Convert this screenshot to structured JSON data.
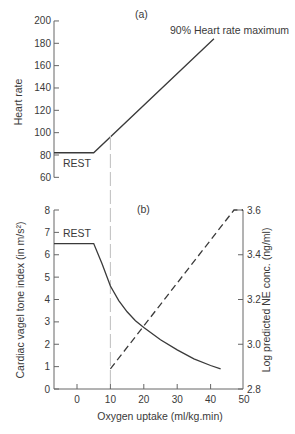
{
  "chart_data": [
    {
      "panel": "(a)",
      "type": "line",
      "title": "",
      "xlabel": "Oxygen uptake (ml/kg.min)",
      "ylabel": "Heart rate",
      "xlim": [
        -8,
        50
      ],
      "ylim": [
        60,
        200
      ],
      "yticks": [
        60,
        80,
        100,
        120,
        140,
        160,
        180,
        200
      ],
      "grid": false,
      "series": [
        {
          "name": "Heart rate",
          "style": "solid",
          "x": [
            -8,
            5,
            41
          ],
          "y": [
            82,
            82,
            184
          ]
        }
      ],
      "annotations": [
        {
          "text": "REST",
          "x": -4,
          "y": 76
        },
        {
          "text": "90% Heart rate maximum",
          "x": 40,
          "y": 190
        },
        {
          "text": "(a)",
          "position": "top-center"
        }
      ],
      "reference_lines": [
        {
          "orientation": "vertical",
          "x": 10,
          "style": "long-dash",
          "color": "#bbbbbb"
        }
      ]
    },
    {
      "panel": "(b)",
      "type": "line",
      "title": "",
      "xlabel": "Oxygen uptake (ml/kg.min)",
      "ylabel": "Cardiac vagel tone index (in m/s²)",
      "y2label": "Log predicted NE conc. (ng/ml)",
      "xlim": [
        -8,
        50
      ],
      "xticks": [
        0,
        10,
        20,
        30,
        40,
        50
      ],
      "ylim": [
        0,
        8
      ],
      "yticks": [
        0,
        1,
        2,
        3,
        4,
        5,
        6,
        7,
        8
      ],
      "y2lim": [
        2.8,
        3.6
      ],
      "y2ticks": [
        2.8,
        3.0,
        3.2,
        3.4,
        3.6
      ],
      "grid": false,
      "series": [
        {
          "name": "Cardiac vagal tone index",
          "axis": "left",
          "style": "solid",
          "x": [
            -8,
            5,
            7.5,
            10,
            12.5,
            15,
            17.5,
            20,
            25,
            30,
            35,
            40,
            43
          ],
          "y": [
            6.5,
            6.5,
            5.6,
            4.6,
            3.95,
            3.45,
            3.05,
            2.75,
            2.2,
            1.75,
            1.35,
            1.05,
            0.9
          ]
        },
        {
          "name": "Log predicted NE conc.",
          "axis": "right",
          "style": "dashed",
          "x": [
            10,
            47
          ],
          "y": [
            2.89,
            3.6
          ]
        }
      ],
      "annotations": [
        {
          "text": "REST",
          "x": -4,
          "y": 6.8
        },
        {
          "text": "(b)",
          "position": "top-center"
        }
      ],
      "reference_lines": [
        {
          "orientation": "vertical",
          "x": 10,
          "style": "long-dash",
          "color": "#bbbbbb"
        }
      ]
    }
  ],
  "labels": {
    "panel_a": "(a)",
    "panel_b": "(b)",
    "rest_a": "REST",
    "rest_b": "REST",
    "hr_max": "90% Heart rate maximum",
    "ylabel_top": "Heart rate",
    "ylabel_bottom_left": "Cardiac vagel tone index (in m/s²)",
    "ylabel_bottom_right": "Log predicted NE conc. (ng/ml)",
    "xlabel": "Oxygen uptake (ml/kg.min)"
  },
  "colors": {
    "line": "#3a3a3a",
    "axis": "#666666",
    "reference": "#c4c4c4"
  }
}
